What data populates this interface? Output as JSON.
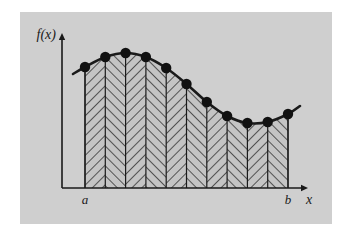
{
  "figure": {
    "panel_bg": "#cfcfcf",
    "page_bg": "#ffffff",
    "ink_color": "#1a1a1a",
    "shade_fill": "#c4c4c4"
  },
  "axes": {
    "y_axis_label": "f(x)",
    "x_axis_label": "x",
    "x_axis_y": 188,
    "y_axis_x": 62,
    "x_axis_start": 62,
    "x_axis_end": 308,
    "y_axis_top": 33,
    "has_arrowheads": true
  },
  "bounds": {
    "lower_label": "a",
    "upper_label": "b",
    "lower_x": 85,
    "upper_x": 288
  },
  "chart_data": {
    "type": "area",
    "xlabel": "x",
    "ylabel": "f(x)",
    "grid": false,
    "legend": null,
    "xlim": [
      62,
      308
    ],
    "ylim": [
      0,
      188
    ],
    "curve_name": "f(x)",
    "strip_count": 10,
    "point_count": 11,
    "curve_extends_beyond_bounds": true,
    "curve_x_start": 73,
    "curve_x_end": 300,
    "node_x": [
      85,
      105.3,
      125.6,
      145.9,
      166.2,
      186.5,
      206.8,
      227.1,
      247.4,
      267.7,
      288
    ],
    "node_y": [
      67,
      57,
      53,
      57,
      68,
      84,
      102,
      116,
      123,
      122,
      114
    ],
    "curve_tail_left": {
      "x": 73,
      "y": 74
    },
    "curve_tail_right": {
      "x": 300,
      "y": 106
    },
    "strip_boundaries_x": [
      85,
      105.3,
      125.6,
      145.9,
      166.2,
      186.5,
      206.8,
      227.1,
      247.4,
      267.7,
      288
    ],
    "hatch_directions": [
      "right",
      "left",
      "right",
      "left",
      "right",
      "left",
      "right",
      "left",
      "right",
      "left"
    ],
    "baseline_y": 188,
    "marker_radius": 5.2,
    "marker_color": "#111111",
    "curve_width": 2.6
  }
}
